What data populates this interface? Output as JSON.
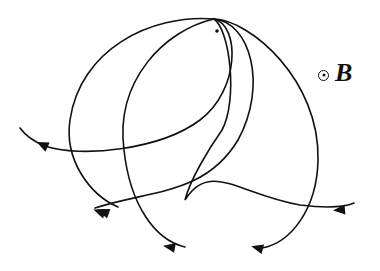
{
  "diagram": {
    "field": {
      "symbol": "dot-in-circle (out of page)",
      "label": "B"
    },
    "source_point": {
      "x": 214,
      "y": 19
    },
    "marker_dot": {
      "x": 217,
      "y": 31
    },
    "stroke_color": "#111111",
    "background": "#ffffff",
    "trajectories": [
      {
        "id": "t1",
        "d": "M214,19 C150,14 80,50 70,120 C64,160 90,195 118,207",
        "arrow": {
          "x": 104,
          "y": 212,
          "angle": 200
        }
      },
      {
        "id": "t2",
        "d": "M214,19 C165,30 115,80 124,150 C130,205 155,240 185,247",
        "arrow": {
          "x": 170,
          "y": 247,
          "angle": 190
        }
      },
      {
        "id": "t3",
        "d": "M214,19 C180,40 168,100 178,160 C188,215 225,245 255,248",
        "arrow": {
          "x": 250,
          "y": 248,
          "angle": 185
        }
      },
      {
        "id": "t4",
        "d": "M214,19 C250,20 320,80 318,160 C317,210 290,243 262,248",
        "arrow": {
          "x": 258,
          "y": 248,
          "angle": 195
        }
      },
      {
        "id": "t5",
        "d": "M214,19 C250,22 268,85 238,140 C205,195 150,190 95,208",
        "arrow": {
          "x": 100,
          "y": 212,
          "angle": 200
        }
      },
      {
        "id": "t6",
        "d": "M214,19 C240,25 240,90 200,120 C160,150 80,158 45,146 C35,142 25,135 20,128",
        "arrow": {
          "x": 43,
          "y": 145,
          "angle": 205
        }
      },
      {
        "id": "t7",
        "d": "M214,19 C230,30 238,100 222,130 C208,150 190,180 185,200 C210,160 240,195 300,205 C325,208 345,207 354,203",
        "arrow": {
          "x": 340,
          "y": 210,
          "angle": 175
        }
      }
    ]
  }
}
